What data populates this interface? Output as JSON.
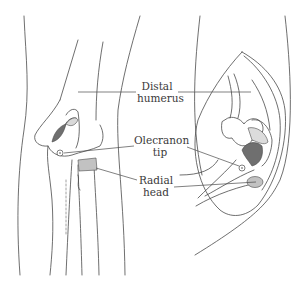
{
  "figure": {
    "type": "anatomical-illustration",
    "line_color": "#4a4a4a",
    "shade_dark": "#707070",
    "shade_light": "#d9d9d9",
    "shade_hatch": "#b8b8b8"
  },
  "labels": {
    "distal_humerus": {
      "line1": "Distal",
      "line2": "humerus"
    },
    "olecranon_tip": {
      "line1": "Olecranon",
      "line2": "tip"
    },
    "radial_head": {
      "line1": "Radial",
      "line2": "head"
    }
  }
}
